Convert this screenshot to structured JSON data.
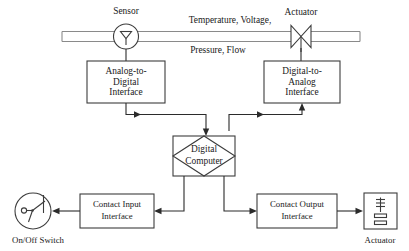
{
  "diagram": {
    "colors": {
      "line": "#2b2b2b",
      "box_stroke": "#3c3c3c",
      "pipe": "#8a8a8a",
      "background": "#ffffff",
      "text": "#1a1a1a"
    },
    "pipe": {
      "signal_label_top": "Temperature, Voltage,",
      "signal_label_bottom": "Pressure, Flow"
    },
    "nodes": {
      "sensor": {
        "label": "Sensor",
        "icon": "sensor-circle-icon"
      },
      "actuator_valve": {
        "label": "Actuator",
        "icon": "valve-bowtie-icon"
      },
      "adc": {
        "line1": "Analog-to-",
        "line2": "Digital",
        "line3": "Interface"
      },
      "dac": {
        "line1": "Digital-to-",
        "line2": "Analog",
        "line3": "Interface"
      },
      "computer": {
        "line1": "Digital",
        "line2": "Computer"
      },
      "contact_input": {
        "line1": "Contact Input",
        "line2": "Interface"
      },
      "contact_output": {
        "line1": "Contact Output",
        "line2": "Interface"
      },
      "switch": {
        "label": "On/Off Switch",
        "icon": "onoff-switch-icon"
      },
      "actuator_box": {
        "label": "Actuator",
        "icon": "solenoid-icon"
      }
    }
  }
}
